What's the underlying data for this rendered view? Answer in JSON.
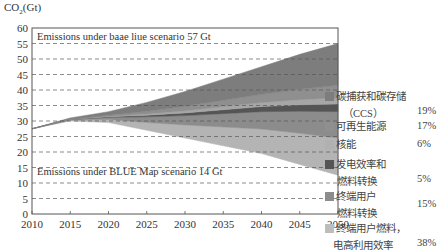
{
  "chart_data": {
    "type": "area",
    "title": "",
    "ylabel": "CO2(Gt)",
    "ylabel_main": "CO",
    "ylabel_sub": "2",
    "ylabel_unit": "(Gt)",
    "xlabel": "",
    "ylim": [
      0,
      60
    ],
    "xlim": [
      2010,
      2050
    ],
    "yticks": [
      0,
      5,
      10,
      15,
      20,
      25,
      30,
      35,
      40,
      45,
      50,
      55,
      60
    ],
    "xticks": [
      2010,
      2015,
      2020,
      2025,
      2030,
      2035,
      2040,
      2045,
      2050
    ],
    "grid": "horizontal dashed",
    "x": [
      2010,
      2015,
      2020,
      2025,
      2030,
      2035,
      2040,
      2045,
      2050
    ],
    "baseline_total": [
      27.5,
      31,
      33,
      36,
      39.5,
      43.5,
      47.5,
      51.5,
      55
    ],
    "blue_map_total": [
      27.5,
      30,
      29.5,
      27,
      24.5,
      22,
      19.5,
      16,
      12.5
    ],
    "series": [
      {
        "name": "终端用户燃料，电高利用效率",
        "share": "38%",
        "color": "#b4b4b4",
        "from_bottom_2050": [
          12.5,
          24.5
        ]
      },
      {
        "name": "终端用户燃料转换",
        "share": "15%",
        "color": "#8c8c8c",
        "from_bottom_2050": [
          24.5,
          33
        ]
      },
      {
        "name": "发电效率和燃料转换",
        "share": "5%",
        "color": "#555555",
        "from_bottom_2050": [
          33,
          35.5
        ]
      },
      {
        "name": "核能",
        "share": "6%",
        "color": "#a6a6a6",
        "from_bottom_2050": [
          35.5,
          37.5
        ]
      },
      {
        "name": "可再生能源",
        "share": "17%",
        "color": "#8f8f8f",
        "from_bottom_2050": [
          37.5,
          41.5
        ]
      },
      {
        "name": "碳捕获和碳存储（CCS）",
        "share": "19%",
        "color": "#7d7d7d",
        "from_bottom_2050": [
          41.5,
          55
        ]
      }
    ],
    "annotations": [
      {
        "text": "Emissions under baae liue scenario 57 Gt",
        "y": 57
      },
      {
        "text": "Emissions under BLUE Map scenario 14 Gt",
        "y": 14
      }
    ],
    "legend_position": "right"
  },
  "legend": [
    {
      "line1": "碳捕获和碳存储",
      "line2": "（CCS）",
      "pct": "19%",
      "color": "#7d7d7d"
    },
    {
      "line1": "可再生能源",
      "line2": "",
      "pct": "17%",
      "color": "#8f8f8f"
    },
    {
      "line1": "核能",
      "line2": "",
      "pct": "6%",
      "color": "#b0b0b0"
    },
    {
      "line1": "发电效率和",
      "line2": "燃料转换",
      "pct": "5%",
      "color": "#555555"
    },
    {
      "line1": "终端用户",
      "line2": "燃料转换",
      "pct": "15%",
      "color": "#8c8c8c"
    },
    {
      "line1": "终端用户燃料，",
      "line2": "电高利用效率",
      "pct": "38%",
      "color": "#bdbdbd"
    }
  ]
}
